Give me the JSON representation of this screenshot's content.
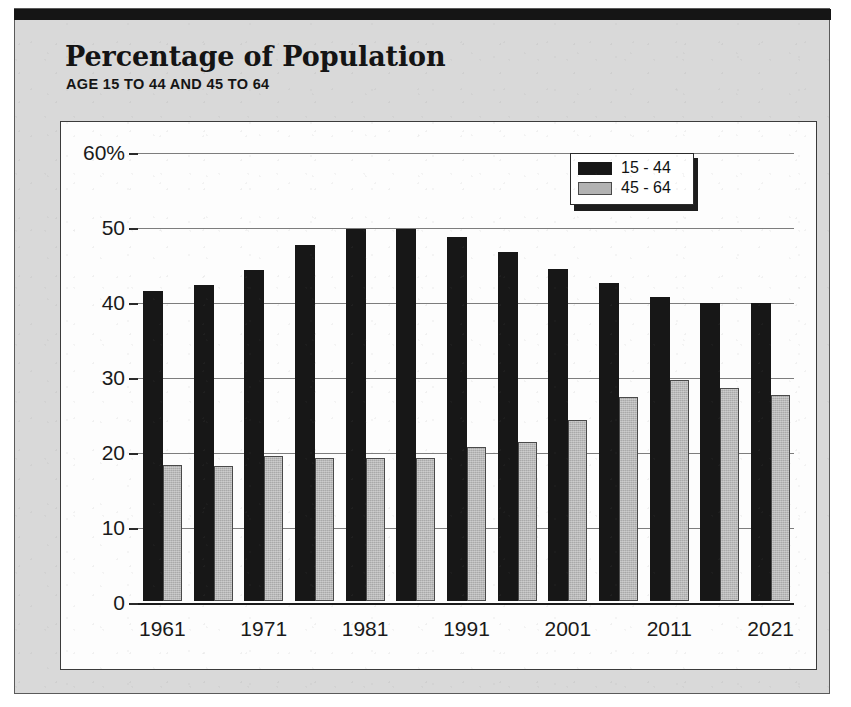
{
  "header": {
    "title": "Percentage of Population",
    "subtitle": "AGE 15 TO 44 AND 45 TO 64"
  },
  "colors": {
    "series_a": "#171717",
    "series_b": "#a9a9a9",
    "frame": "#d9d9d9",
    "panel": "#fdfdfd",
    "gridline": "#7d7d7d",
    "axis": "#1b1b1b"
  },
  "legend": {
    "position": "top-right",
    "entries": [
      {
        "label": "15 - 44",
        "swatch": "series-a"
      },
      {
        "label": "45 - 64",
        "swatch": "series-b"
      }
    ]
  },
  "chart_data": {
    "type": "bar",
    "title": "Percentage of Population",
    "subtitle": "AGE 15 TO 44 AND 45 TO 64",
    "xlabel": "",
    "ylabel": "",
    "ylim": [
      0,
      62
    ],
    "yticks": [
      0,
      10,
      20,
      30,
      40,
      50,
      60
    ],
    "ytick_labels": [
      "0",
      "10",
      "20",
      "30",
      "40",
      "50",
      "60%"
    ],
    "grid": true,
    "grid_axis": "y",
    "categories": [
      "1961",
      "1966",
      "1971",
      "1976",
      "1981",
      "1986",
      "1991",
      "1996",
      "2001",
      "2006",
      "2011",
      "2016",
      "2021"
    ],
    "xtick_labels": [
      "1961",
      "",
      "1971",
      "",
      "1981",
      "",
      "1991",
      "",
      "2001",
      "",
      "2011",
      "",
      "2021"
    ],
    "series": [
      {
        "name": "15 - 44",
        "values": [
          41.4,
          42.1,
          44.2,
          47.5,
          49.6,
          49.6,
          48.5,
          46.5,
          44.3,
          42.4,
          40.5,
          39.8,
          39.8
        ]
      },
      {
        "name": "45 - 64",
        "values": [
          18.1,
          18.0,
          19.3,
          19.1,
          19.1,
          19.1,
          20.5,
          21.2,
          24.2,
          27.2,
          29.5,
          28.4,
          27.5
        ]
      }
    ]
  }
}
